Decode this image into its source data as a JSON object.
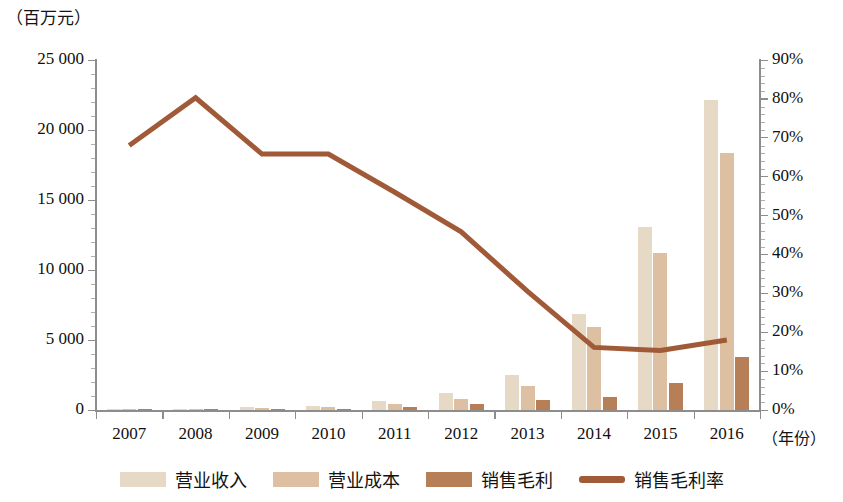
{
  "chart_data": {
    "type": "bar",
    "title": "",
    "subtitle": "",
    "xlabel": "（年份）",
    "ylabel": "（百万元）",
    "y2label": "",
    "categories": [
      "2007",
      "2008",
      "2009",
      "2010",
      "2011",
      "2012",
      "2013",
      "2014",
      "2015",
      "2016"
    ],
    "ylim": [
      0,
      25000
    ],
    "y2lim": [
      0,
      90
    ],
    "yticks": [
      "0",
      "5 000",
      "10 000",
      "15 000",
      "20 000",
      "25 000"
    ],
    "ytick_values": [
      0,
      5000,
      10000,
      15000,
      20000,
      25000
    ],
    "y2ticks": [
      "0%",
      "10%",
      "20%",
      "30%",
      "40%",
      "50%",
      "60%",
      "70%",
      "80%",
      "90%"
    ],
    "y2tick_values": [
      0,
      10,
      20,
      30,
      40,
      50,
      60,
      70,
      80,
      90
    ],
    "grid": false,
    "legend_position": "bottom",
    "series": [
      {
        "name": "营业收入",
        "type": "bar",
        "axis": "left",
        "color": "#e6dac6",
        "values": [
          40,
          90,
          180,
          290,
          620,
          1250,
          2480,
          6880,
          13100,
          22150
        ]
      },
      {
        "name": "营业成本",
        "type": "bar",
        "axis": "left",
        "color": "#ddbfa2",
        "values": [
          20,
          55,
          110,
          190,
          420,
          820,
          1730,
          5930,
          11180,
          18380
        ]
      },
      {
        "name": "销售毛利",
        "type": "bar",
        "axis": "left",
        "color": "#b77f57",
        "values": [
          20,
          35,
          70,
          100,
          200,
          430,
          750,
          950,
          1920,
          3770
        ]
      },
      {
        "name": "销售毛利率",
        "type": "line",
        "axis": "right",
        "color": "#a05a37",
        "values": [
          68.0,
          80.3,
          65.8,
          65.8,
          56.0,
          45.8,
          30.5,
          16.1,
          15.3,
          18.0
        ]
      }
    ]
  },
  "legend": {
    "items": [
      {
        "label": "营业收入",
        "marker": "square",
        "color": "#e6dac6"
      },
      {
        "label": "营业成本",
        "marker": "square",
        "color": "#ddbfa2"
      },
      {
        "label": "销售毛利",
        "marker": "square",
        "color": "#b77f57"
      },
      {
        "label": "销售毛利率",
        "marker": "line",
        "color": "#a05a37"
      }
    ]
  },
  "colors": {
    "revenue": "#e6dac6",
    "cost": "#ddbfa2",
    "profit": "#b77f57",
    "margin_line": "#a05a37",
    "axis": "#8d8d8d",
    "text": "#101010",
    "background": "#ffffff"
  }
}
